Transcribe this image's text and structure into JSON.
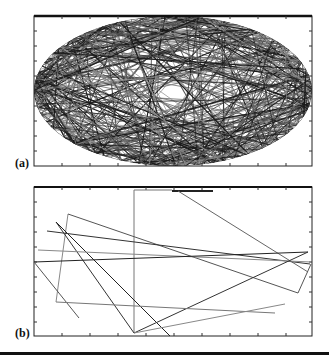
{
  "figure": {
    "panels": [
      {
        "id": "a",
        "label": "(a)",
        "description": "Dense trajectory of chords inside an elliptical billiard",
        "frame": {
          "x": 34,
          "y": 16,
          "width": 278,
          "height": 150
        },
        "ellipse": {
          "cx": 173,
          "cy": 91,
          "rx": 139,
          "ry": 75
        }
      },
      {
        "id": "b",
        "label": "(b)",
        "description": "Sparse set of straight trajectory segments",
        "frame": {
          "x": 34,
          "y": 187,
          "width": 278,
          "height": 149
        }
      }
    ]
  },
  "chart_data": [
    {
      "type": "line",
      "title": "(a)",
      "xlabel": "",
      "ylabel": "",
      "grid": false,
      "notes": "Chaotic ray trajectory filling an elliptical region; many chord segments between boundary points",
      "boundary": "ellipse",
      "series": []
    },
    {
      "type": "line",
      "title": "(b)",
      "xlabel": "",
      "ylabel": "",
      "grid": false,
      "segments_px": [
        [
          [
            134,
            333
          ],
          [
            134,
            190
          ]
        ],
        [
          [
            134,
            190
          ],
          [
            172,
            190
          ]
        ],
        [
          [
            172,
            191
          ],
          [
            213,
            191
          ]
        ],
        [
          [
            178,
            191
          ],
          [
            308,
            272
          ]
        ],
        [
          [
            68,
            214
          ],
          [
            56,
            302
          ]
        ],
        [
          [
            68,
            214
          ],
          [
            298,
            293
          ]
        ],
        [
          [
            298,
            293
          ],
          [
            311,
            264
          ]
        ],
        [
          [
            56,
            222
          ],
          [
            134,
            333
          ]
        ],
        [
          [
            56,
            222
          ],
          [
            170,
            336
          ]
        ],
        [
          [
            47,
            231
          ],
          [
            310,
            264
          ]
        ],
        [
          [
            38,
            250
          ],
          [
            311,
            262
          ]
        ],
        [
          [
            34,
            262
          ],
          [
            308,
            252
          ]
        ],
        [
          [
            134,
            333
          ],
          [
            308,
            252
          ]
        ],
        [
          [
            34,
            262
          ],
          [
            79,
            318
          ]
        ],
        [
          [
            56,
            302
          ],
          [
            275,
            313
          ]
        ],
        [
          [
            134,
            333
          ],
          [
            285,
            304
          ]
        ]
      ]
    }
  ]
}
